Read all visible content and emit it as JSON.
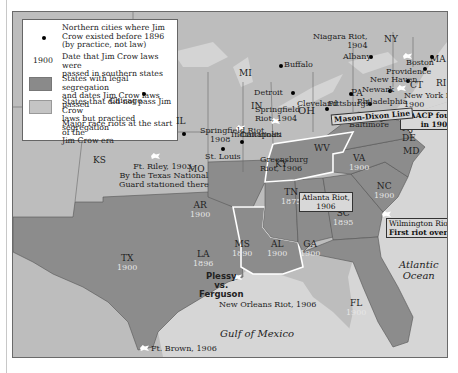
{
  "legend": {
    "items": [
      {
        "symbol": "black-dot",
        "text_lines": [
          "Northern cities where Jim",
          "Crow existed before 1896",
          "(by practice, not law)"
        ]
      },
      {
        "symbol": "1900",
        "text_lines": [
          "Date that Jim Crow laws were",
          "passed in southern states"
        ]
      },
      {
        "symbol": "dark-swatch",
        "text_lines": [
          "States with legal segregation",
          "and dates Jim Crow laws passed"
        ]
      },
      {
        "symbol": "light-swatch",
        "text_lines": [
          "States that did not pass Jim Crow",
          "laws but practiced segregation"
        ]
      },
      {
        "symbol": "riot-icon",
        "text_lines": [
          "Major race riots at the start of the",
          "Jim Crow era"
        ]
      }
    ]
  },
  "colors": {
    "segregation_states": "#8a8a8a",
    "non_law_states": "#bdbdbd",
    "water": "#d4d4d4",
    "highlight_border": "#ffffff"
  },
  "states": [
    {
      "abbr": "NY"
    },
    {
      "abbr": "MA"
    },
    {
      "abbr": "CT"
    },
    {
      "abbr": "RI"
    },
    {
      "abbr": "PA"
    },
    {
      "abbr": "NJ"
    },
    {
      "abbr": "DE"
    },
    {
      "abbr": "MD"
    },
    {
      "abbr": "MI"
    },
    {
      "abbr": "OH"
    },
    {
      "abbr": "IN"
    },
    {
      "abbr": "IL"
    },
    {
      "abbr": "WV"
    },
    {
      "abbr": "KY"
    },
    {
      "abbr": "MO"
    },
    {
      "abbr": "KS"
    },
    {
      "abbr": "VA",
      "year": "1900"
    },
    {
      "abbr": "NC",
      "year": "1900"
    },
    {
      "abbr": "SC",
      "year": "1895"
    },
    {
      "abbr": "TN",
      "year": "1875"
    },
    {
      "abbr": "GA",
      "year": "1900"
    },
    {
      "abbr": "AL",
      "year": "1900"
    },
    {
      "abbr": "MS",
      "year": "1890"
    },
    {
      "abbr": "AR",
      "year": "1900"
    },
    {
      "abbr": "LA",
      "year": "1896"
    },
    {
      "abbr": "TX",
      "year": "1900"
    },
    {
      "abbr": "FL",
      "year": "1900"
    }
  ],
  "cities": [
    "Albany",
    "Boston",
    "Providence",
    "Buffalo",
    "New Haven",
    "Newark",
    "Philadelphia",
    "Pittsburgh",
    "Baltimore",
    "Detroit",
    "Chicago",
    "Cleveland",
    "Indianapolis",
    "Cincinnati",
    "St. Louis"
  ],
  "riots": [
    {
      "line1": "Niagara Riot,",
      "line2": "1904"
    },
    {
      "line1": "New York Riot,",
      "line2": "1900"
    },
    {
      "line1": "Springfield",
      "line2": "Riot, 1904"
    },
    {
      "line1": "Springfield Riot,",
      "line2": "1908"
    },
    {
      "line1": "Greensburg",
      "line2": "Riot, 1906"
    },
    {
      "line1": "Atlanta Riot,",
      "line2": "1906"
    },
    {
      "line1": "Wilmington Riot, 1898:",
      "line2": "First riot over Jim Crow"
    },
    {
      "line1": "New Orleans Riot, 1906"
    },
    {
      "line1": "Ft. Brown, 1906"
    },
    {
      "line1": "Ft. Riley, 1903:",
      "line2": "By the Texas National",
      "line3": "Guard stationed there"
    }
  ],
  "annotations": {
    "naacp": [
      "NAACP founded",
      "in 1909"
    ],
    "mason_dixon": "Mason-Dixon Line",
    "plessy": [
      "Plessy",
      "vs.",
      "Ferguson"
    ]
  },
  "water": {
    "atlantic": [
      "Atlantic",
      "Ocean"
    ],
    "gulf": "Gulf of Mexico"
  }
}
